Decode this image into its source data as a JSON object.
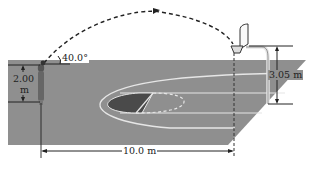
{
  "figure": {
    "labels": {
      "launch_angle": "40.0°",
      "release_height_value": "2.00",
      "release_height_unit": "m",
      "hoop_height": "3.05 m",
      "horizontal_distance": "10.0 m"
    },
    "colors": {
      "court": "#8f8f8f",
      "court_lines": "#e6e6e6",
      "key_shaded": "#4a4a4a",
      "lines": "#222222",
      "background": "#ffffff"
    }
  }
}
